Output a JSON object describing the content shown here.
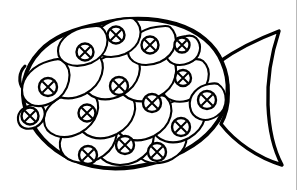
{
  "page": {
    "kind": "line-art-coloring-page",
    "alt_text": "Black and white outline drawing of a fish with overlapping teardrop scales, each scale marked with a small circle containing an X",
    "width": 303,
    "height": 190,
    "background_color": "#ffffff",
    "ink_color": "#000000",
    "rule_color": "#b9b9b9"
  },
  "artwork": {
    "subject": "fish",
    "style": "hand-drawn ink outline, uncolored",
    "parts": [
      {
        "id": "body",
        "name": "fish-body-outline",
        "label": "Fish body outline"
      },
      {
        "id": "tail",
        "name": "fish-tail-outline",
        "label": "Fish tail fin"
      },
      {
        "id": "scales",
        "name": "fish-scale-group",
        "label": "Overlapping scales"
      },
      {
        "id": "lips",
        "name": "fish-mouth-outline",
        "label": "Mouth / lip bump"
      }
    ],
    "scale_count": 18,
    "marked_scale_count": 18,
    "scale_mark": "circle-with-x",
    "body_outline": "M 96 26 C 118 19, 148 18, 174 24 C 196 29, 213 42, 221 58 C 230 76, 231 97, 222 116 C 212 137, 190 153, 163 162 C 134 172, 102 172, 77 161 C 54 151, 36 133, 28 113 C 20 93, 22 70, 36 52 C 50 35, 72 28, 96 26 Z",
    "tail_outline": "M 220 63 C 241 48, 264 38, 281 33 C 277 52, 271 82, 272 106 C 273 130, 278 150, 283 162 C 262 157, 238 141, 223 124 C 232 106, 233 83, 220 63 Z",
    "lips_outline": "M 26 63 C 21 68, 20 77, 24 83",
    "tail_notch": "M 223 124 C 238 112, 241 95, 235 80",
    "scales": [
      {
        "id": "s1",
        "name": "scale-dorsal-1",
        "cx": 84,
        "cy": 52,
        "rx": 23,
        "ry": 19,
        "rot": -18,
        "mark_cx": 85,
        "mark_cy": 52,
        "mark_r": 8
      },
      {
        "id": "s2",
        "name": "scale-dorsal-2",
        "cx": 116,
        "cy": 37,
        "rx": 20,
        "ry": 18,
        "rot": -8,
        "mark_cx": 116,
        "mark_cy": 35,
        "mark_r": 8
      },
      {
        "id": "s3",
        "name": "scale-dorsal-3",
        "cx": 150,
        "cy": 46,
        "rx": 21,
        "ry": 19,
        "rot": 6,
        "mark_cx": 150,
        "mark_cy": 45,
        "mark_r": 8
      },
      {
        "id": "s4",
        "name": "scale-dorsal-4",
        "cx": 182,
        "cy": 47,
        "rx": 15,
        "ry": 14,
        "rot": 12,
        "mark_cx": 182,
        "mark_cy": 45,
        "mark_r": 7
      },
      {
        "id": "s5",
        "name": "scale-head-upper",
        "cx": 49,
        "cy": 86,
        "rx": 24,
        "ry": 21,
        "rot": -4,
        "mark_cx": 49,
        "mark_cy": 86,
        "mark_r": 9
      },
      {
        "id": "s6",
        "name": "scale-mid-1",
        "cx": 90,
        "cy": 82,
        "rx": 24,
        "ry": 22,
        "rot": -6,
        "mark_cx": 88,
        "mark_cy": 113,
        "mark_r": 8
      },
      {
        "id": "s7",
        "name": "scale-mid-2",
        "cx": 122,
        "cy": 78,
        "rx": 24,
        "ry": 22,
        "rot": 4,
        "mark_cx": 120,
        "mark_cy": 86,
        "mark_r": 9
      },
      {
        "id": "s8",
        "name": "scale-mid-3",
        "cx": 157,
        "cy": 87,
        "rx": 24,
        "ry": 22,
        "rot": 8,
        "mark_cx": 153,
        "mark_cy": 103,
        "mark_r": 9
      },
      {
        "id": "s9",
        "name": "scale-mid-4",
        "cx": 186,
        "cy": 79,
        "rx": 19,
        "ry": 18,
        "rot": 10,
        "mark_cx": 183,
        "mark_cy": 78,
        "mark_r": 8
      },
      {
        "id": "s10",
        "name": "scale-cheek",
        "cx": 31,
        "cy": 116,
        "rx": 13,
        "ry": 12,
        "rot": 0,
        "mark_cx": 30,
        "mark_cy": 116,
        "mark_r": 8
      },
      {
        "id": "s11",
        "name": "scale-lower-1",
        "cx": 68,
        "cy": 120,
        "rx": 25,
        "ry": 23,
        "rot": -8,
        "mark_cx": 87,
        "mark_cy": 113,
        "mark_r": 8
      },
      {
        "id": "s12",
        "name": "scale-lower-2",
        "cx": 102,
        "cy": 118,
        "rx": 24,
        "ry": 23,
        "rot": 2,
        "mark_cx": 152,
        "mark_cy": 103,
        "mark_r": 9
      },
      {
        "id": "s13",
        "name": "scale-lower-3",
        "cx": 139,
        "cy": 122,
        "rx": 24,
        "ry": 23,
        "rot": 8,
        "mark_cx": 181,
        "mark_cy": 127,
        "mark_r": 9
      },
      {
        "id": "s14",
        "name": "scale-lower-4",
        "cx": 175,
        "cy": 123,
        "rx": 20,
        "ry": 19,
        "rot": 14,
        "mark_cx": 181,
        "mark_cy": 127,
        "mark_r": 9
      },
      {
        "id": "s15",
        "name": "scale-ventral-1",
        "cx": 87,
        "cy": 148,
        "rx": 22,
        "ry": 19,
        "rot": -6,
        "mark_cx": 88,
        "mark_cy": 156,
        "mark_r": 9
      },
      {
        "id": "s16",
        "name": "scale-ventral-2",
        "cx": 125,
        "cy": 150,
        "rx": 22,
        "ry": 19,
        "rot": 6,
        "mark_cx": 124,
        "mark_cy": 145,
        "mark_r": 9
      },
      {
        "id": "s17",
        "name": "scale-ventral-3",
        "cx": 158,
        "cy": 148,
        "rx": 20,
        "ry": 18,
        "rot": 12,
        "mark_cx": 157,
        "mark_cy": 152,
        "mark_r": 9
      },
      {
        "id": "s18",
        "name": "scale-caudal",
        "cx": 207,
        "cy": 100,
        "rx": 17,
        "ry": 17,
        "rot": 0,
        "mark_cx": 207,
        "mark_cy": 100,
        "mark_r": 9
      }
    ]
  },
  "page_rule": {
    "name": "right-margin-rule",
    "x": 296.5,
    "visible": true
  }
}
